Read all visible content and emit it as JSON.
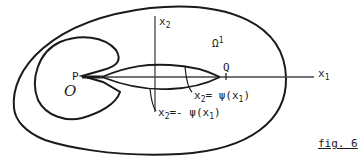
{
  "figure": {
    "caption": "fig. 6",
    "stroke_color": "#1a1a1a",
    "background": "#ffffff"
  },
  "labels": {
    "x2_axis": {
      "base": "x",
      "sub": "2"
    },
    "x1_axis": {
      "base": "x",
      "sub": "1"
    },
    "omega": {
      "base": "Ω",
      "sup": "1"
    },
    "point_p": "P",
    "point_q": "Q",
    "region_o": "O",
    "upper_curve": {
      "x": "x",
      "sub": "2",
      "rest": "= ψ(x",
      "sub2": "1",
      "close": ")"
    },
    "lower_curve": {
      "x": "x",
      "sub": "2",
      "rest": "=- ψ(x",
      "sub2": "1",
      "close": ")"
    }
  }
}
